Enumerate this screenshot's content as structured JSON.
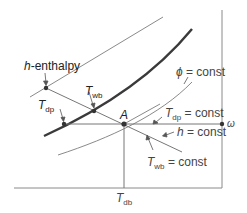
{
  "colors": {
    "thin_line": "#8a8a8a",
    "saturation_curve": "#3a3a3a",
    "text": "#444444",
    "dot": "#333333"
  },
  "labels": {
    "h_enthalpy_italic": "h",
    "h_enthalpy_rest": "-enthalpy",
    "twb_T": "T",
    "twb_sub": "wb",
    "tdp_T": "T",
    "tdp_sub": "dp",
    "point_a": "A",
    "phi_symbol": "ϕ",
    "phi_const": " = const",
    "tdp_const_T": "T",
    "tdp_const_sub": "dp",
    "tdp_const_rest": " = const",
    "h_const_italic": "h",
    "h_const_rest": " = const",
    "twb_const_T": "T",
    "twb_const_sub": "wb",
    "twb_const_rest": " = const",
    "omega": "ω",
    "tdb_T": "T",
    "tdb_sub": "db"
  },
  "elements": {
    "state_point": "A",
    "vertical_axis": "ω (humidity ratio)",
    "horizontal_axis": "T_db (dry-bulb temperature)",
    "curves": [
      "saturation curve (ϕ = 100%)",
      "ϕ = const",
      "h-enthalpy line",
      "T_wb = const line",
      "T_dp = const line"
    ]
  }
}
